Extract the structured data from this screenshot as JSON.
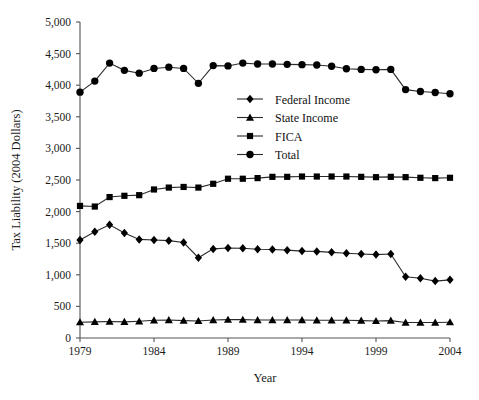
{
  "chart_data": {
    "type": "line",
    "title": "",
    "xlabel": "Year",
    "ylabel": "Tax Liability (2004 Dollars)",
    "xlim": [
      1979,
      2004
    ],
    "ylim": [
      0,
      5000
    ],
    "grid": false,
    "legend_position": "inside-upper-right",
    "x": [
      1979,
      1980,
      1981,
      1982,
      1983,
      1984,
      1985,
      1986,
      1987,
      1988,
      1989,
      1990,
      1991,
      1992,
      1993,
      1994,
      1995,
      1996,
      1997,
      1998,
      1999,
      2000,
      2001,
      2002,
      2003,
      2004
    ],
    "xticks": [
      1979,
      1984,
      1989,
      1994,
      1999,
      2004
    ],
    "xtick_labels": [
      "1979",
      "1984",
      "1989",
      "1994",
      "1999",
      "2004"
    ],
    "yticks": [
      0,
      500,
      1000,
      1500,
      2000,
      2500,
      3000,
      3500,
      4000,
      4500,
      5000
    ],
    "ytick_labels": [
      "0",
      "500",
      "1,000",
      "1,500",
      "2,000",
      "2,500",
      "3,000",
      "3,500",
      "4,000",
      "4,500",
      "5,000"
    ],
    "series": [
      {
        "name": "Federal Income",
        "marker": "diamond",
        "values": [
          1550,
          1680,
          1790,
          1660,
          1560,
          1550,
          1540,
          1510,
          1270,
          1410,
          1425,
          1420,
          1405,
          1400,
          1390,
          1375,
          1370,
          1355,
          1340,
          1330,
          1320,
          1330,
          970,
          945,
          900,
          920
        ]
      },
      {
        "name": "State Income",
        "marker": "triangle",
        "values": [
          250,
          255,
          260,
          255,
          265,
          280,
          285,
          275,
          270,
          285,
          290,
          290,
          285,
          285,
          285,
          285,
          280,
          280,
          280,
          275,
          270,
          275,
          245,
          245,
          245,
          250
        ]
      },
      {
        "name": "FICA",
        "marker": "square",
        "values": [
          2090,
          2080,
          2230,
          2250,
          2260,
          2350,
          2380,
          2390,
          2380,
          2440,
          2520,
          2520,
          2530,
          2550,
          2550,
          2555,
          2555,
          2555,
          2555,
          2550,
          2545,
          2550,
          2545,
          2535,
          2530,
          2535
        ]
      },
      {
        "name": "Total",
        "marker": "circle",
        "values": [
          3890,
          4065,
          4350,
          4235,
          4190,
          4265,
          4285,
          4265,
          4030,
          4310,
          4305,
          4350,
          4335,
          4335,
          4330,
          4325,
          4320,
          4300,
          4260,
          4250,
          4245,
          4250,
          3930,
          3900,
          3885,
          3865
        ]
      }
    ]
  },
  "legend": {
    "entries": [
      {
        "label": "Federal Income",
        "marker": "diamond"
      },
      {
        "label": "State Income",
        "marker": "triangle"
      },
      {
        "label": "FICA",
        "marker": "square"
      },
      {
        "label": "Total",
        "marker": "circle"
      }
    ]
  },
  "colors": {
    "marker": "#000000",
    "line": "#2b2b2b",
    "axis": "#555555",
    "text": "#1a1a1a",
    "background": "#ffffff"
  }
}
